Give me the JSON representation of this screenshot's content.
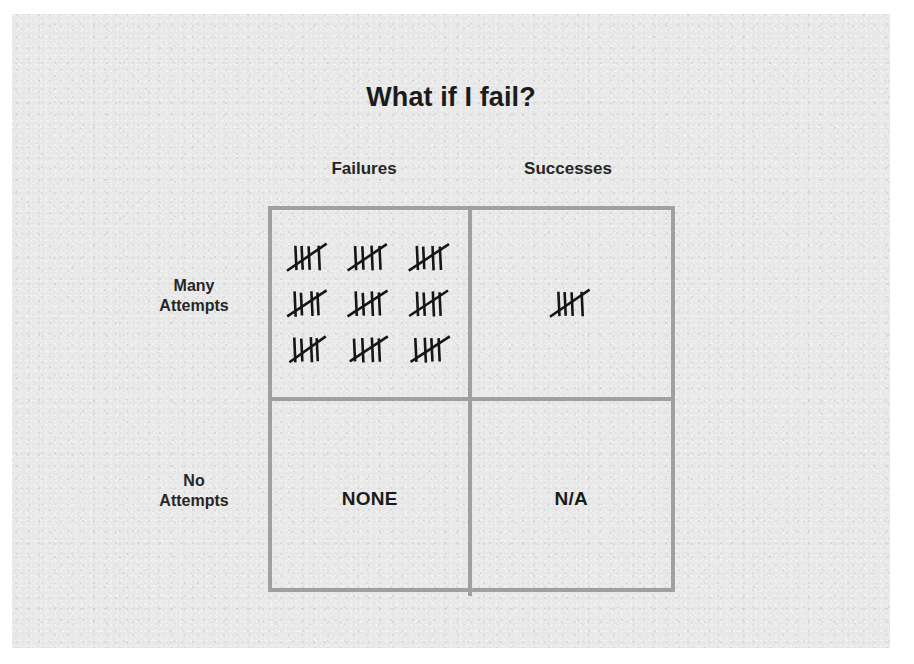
{
  "slide": {
    "title": "What if I fail?",
    "background_color": "#e8e8e8",
    "border_color": "#a0a0a0",
    "text_color": "#1b1b1b"
  },
  "matrix": {
    "column_headers": [
      "Failures",
      "Successes"
    ],
    "row_labels": [
      {
        "line1": "Many",
        "line2": "Attempts"
      },
      {
        "line1": "No",
        "line2": "Attempts"
      }
    ],
    "cells": {
      "many_failures": {
        "kind": "tally",
        "groups": 9,
        "per_group": 5,
        "total": 45,
        "rows": 3,
        "cols": 3
      },
      "many_successes": {
        "kind": "tally",
        "groups": 1,
        "per_group": 5,
        "total": 5,
        "rows": 1,
        "cols": 1
      },
      "no_failures": {
        "kind": "text",
        "text": "NONE"
      },
      "no_successes": {
        "kind": "text",
        "text": "N/A"
      }
    }
  },
  "chart_data": {
    "type": "table",
    "title": "What if I fail?",
    "columns": [
      "Failures",
      "Successes"
    ],
    "rows": [
      "Many Attempts",
      "No Attempts"
    ],
    "values": [
      [
        45,
        5
      ],
      [
        "NONE",
        "N/A"
      ]
    ],
    "value_encoding": "tally-marks (groups of 5)"
  }
}
